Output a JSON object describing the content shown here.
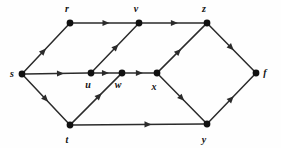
{
  "figure": {
    "background_color": "#fefefe",
    "edge_color": "#2b2b2b",
    "node_color": "#111111",
    "label_color": "#111111",
    "node_radius": 3.4,
    "edge_width": 1.5
  },
  "nodes": [
    {
      "id": "s",
      "label": "s",
      "x": 22,
      "y": 74,
      "label_x": 12,
      "label_y": 77
    },
    {
      "id": "r",
      "label": "r",
      "x": 70,
      "y": 23,
      "label_x": 67,
      "label_y": 12
    },
    {
      "id": "t",
      "label": "t",
      "x": 70,
      "y": 125,
      "label_x": 67,
      "label_y": 143
    },
    {
      "id": "u",
      "label": "u",
      "x": 91,
      "y": 73,
      "label_x": 88,
      "label_y": 88
    },
    {
      "id": "w",
      "label": "w",
      "x": 122,
      "y": 73,
      "label_x": 118,
      "label_y": 88
    },
    {
      "id": "v",
      "label": "v",
      "x": 139,
      "y": 23,
      "label_x": 136,
      "label_y": 12
    },
    {
      "id": "x",
      "label": "x",
      "x": 157,
      "y": 73,
      "label_x": 154,
      "label_y": 90
    },
    {
      "id": "z",
      "label": "z",
      "x": 207,
      "y": 23,
      "label_x": 204,
      "label_y": 12
    },
    {
      "id": "y",
      "label": "y",
      "x": 207,
      "y": 124,
      "label_x": 204,
      "label_y": 143
    },
    {
      "id": "f",
      "label": "f",
      "x": 256,
      "y": 73,
      "label_x": 265,
      "label_y": 76
    }
  ],
  "edges": [
    {
      "id": "s-r",
      "from": "s",
      "to": "r",
      "arrow_at": 0.5
    },
    {
      "id": "s-u",
      "from": "s",
      "to": "u",
      "arrow_at": 0.62
    },
    {
      "id": "s-t",
      "from": "s",
      "to": "t",
      "arrow_at": 0.55
    },
    {
      "id": "r-v",
      "from": "r",
      "to": "v",
      "arrow_at": 0.58
    },
    {
      "id": "u-v",
      "from": "u",
      "to": "v",
      "arrow_at": 0.58
    },
    {
      "id": "u-w",
      "from": "u",
      "to": "w",
      "arrow_at": 0.6
    },
    {
      "id": "t-w",
      "from": "t",
      "to": "w",
      "arrow_at": 0.62
    },
    {
      "id": "t-y",
      "from": "t",
      "to": "y",
      "arrow_at": 0.6
    },
    {
      "id": "w-x",
      "from": "w",
      "to": "x",
      "arrow_at": 0.62
    },
    {
      "id": "v-z",
      "from": "v",
      "to": "z",
      "arrow_at": 0.58
    },
    {
      "id": "x-z",
      "from": "x",
      "to": "z",
      "arrow_at": 0.48
    },
    {
      "id": "x-y",
      "from": "x",
      "to": "y",
      "arrow_at": 0.55
    },
    {
      "id": "z-f",
      "from": "z",
      "to": "f",
      "arrow_at": 0.55
    },
    {
      "id": "y-f",
      "from": "y",
      "to": "f",
      "arrow_at": 0.55
    }
  ]
}
